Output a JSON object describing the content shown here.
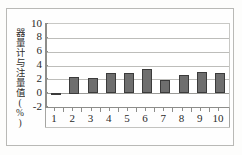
{
  "chart_data": {
    "type": "bar",
    "title": "",
    "subtitle": "",
    "xlabel": "",
    "ylabel": "器量计与注量值(%)",
    "categories": [
      "1",
      "2",
      "3",
      "4",
      "5",
      "6",
      "7",
      "8",
      "9",
      "10"
    ],
    "values": [
      -0.1,
      2.4,
      2.2,
      2.85,
      2.9,
      3.45,
      1.95,
      2.65,
      3.05,
      2.95
    ],
    "series": [
      {
        "name": "",
        "values": [
          -0.1,
          2.4,
          2.2,
          2.85,
          2.9,
          3.45,
          1.95,
          2.65,
          3.05,
          2.95
        ]
      }
    ],
    "ylim": [
      -2,
      10
    ],
    "xlim": [
      0.5,
      10.5
    ],
    "y_ticks": [
      "10",
      "8",
      "6",
      "4",
      "2",
      "0",
      "-2"
    ],
    "y_tick_values": [
      10,
      8,
      6,
      4,
      2,
      0,
      -2
    ],
    "x_ticks": [
      "1",
      "2",
      "3",
      "4",
      "5",
      "6",
      "7",
      "8",
      "9",
      "10"
    ],
    "grid": true,
    "grid_axis": "y",
    "legend": false,
    "legend_position": "none",
    "bar_color": "#6e6e6e",
    "bar_border_color": "#3b3b3b",
    "gridline_color": "#bdbdba",
    "axis_color": "#8d8d8a",
    "plot_background": "#ffffff",
    "figure_background": "#fdfdfc",
    "frame_border_color": "#b9b9b6"
  }
}
